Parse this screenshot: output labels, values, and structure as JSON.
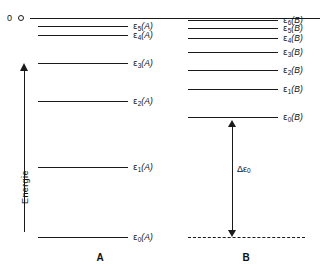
{
  "figure": {
    "zero_marker_label": "0",
    "energy_axis_label": "Energie",
    "delta_label_prefix": "Δε",
    "delta_label_sub": "0",
    "column_a_caption": "A",
    "column_b_caption": "B",
    "line_color": "#1a1a1a",
    "background_color": "#ffffff"
  },
  "chart_data": {
    "type": "diagram",
    "title": "",
    "subtitle": "",
    "xlabel": "",
    "ylabel": "Energie",
    "grid": false,
    "legend": "none",
    "y_axis_direction": "increasing upward toward zero reference",
    "reference_line": {
      "label": "0",
      "y": 18,
      "x_start": 30,
      "x_end": 320
    },
    "annotations": [
      {
        "name": "delta-epsilon-0",
        "text": "Δε₀",
        "type": "double-headed-arrow",
        "from_level": "ε₀(B)",
        "to_level": "ε₀(A)",
        "x": 232,
        "y_top": 120,
        "y_bottom": 237
      },
      {
        "name": "dashed-baseline",
        "type": "dashed-line",
        "y": 237,
        "x_start": 188,
        "x_end": 305,
        "meaning": "extension of ε₀(A) level across system B"
      }
    ],
    "series": [
      {
        "name": "A",
        "caption": "A",
        "caption_x": 100,
        "line_x_start": 38,
        "line_x_end": 128,
        "label_x": 133,
        "levels": [
          {
            "index": 5,
            "prefix": "ε",
            "sub": "5",
            "system": "(A)",
            "y": 26
          },
          {
            "index": 4,
            "prefix": "ε",
            "sub": "4",
            "system": "(A)",
            "y": 35
          },
          {
            "index": 3,
            "prefix": "ε",
            "sub": "3",
            "system": "(A)",
            "y": 63
          },
          {
            "index": 2,
            "prefix": "ε",
            "sub": "2",
            "system": "(A)",
            "y": 101
          },
          {
            "index": 1,
            "prefix": "ε",
            "sub": "1",
            "system": "(A)",
            "y": 167
          },
          {
            "index": 0,
            "prefix": "ε",
            "sub": "0",
            "system": "(A)",
            "y": 237
          }
        ]
      },
      {
        "name": "B",
        "caption": "B",
        "caption_x": 246,
        "line_x_start": 188,
        "line_x_end": 278,
        "label_x": 283,
        "levels": [
          {
            "index": 6,
            "prefix": "ε",
            "sub": "6",
            "system": "(B)",
            "y": 20
          },
          {
            "index": 5,
            "prefix": "ε",
            "sub": "5",
            "system": "(B)",
            "y": 28
          },
          {
            "index": 4,
            "prefix": "ε",
            "sub": "4",
            "system": "(B)",
            "y": 38
          },
          {
            "index": 3,
            "prefix": "ε",
            "sub": "3",
            "system": "(B)",
            "y": 52
          },
          {
            "index": 2,
            "prefix": "ε",
            "sub": "2",
            "system": "(B)",
            "y": 70
          },
          {
            "index": 1,
            "prefix": "ε",
            "sub": "1",
            "system": "(B)",
            "y": 89
          },
          {
            "index": 0,
            "prefix": "ε",
            "sub": "0",
            "system": "(B)",
            "y": 117
          }
        ]
      }
    ]
  }
}
